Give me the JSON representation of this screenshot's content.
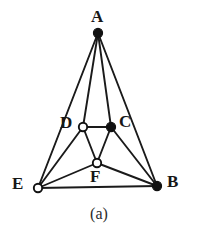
{
  "figure": {
    "caption": "(a)",
    "caption_x": 99,
    "caption_y": 205,
    "width": 198,
    "height": 238,
    "background_color": "#ffffff",
    "ink_color": "#171717",
    "edge_color": "#1a1a1a",
    "edge_width": 1.9,
    "filled_vertex_fill": "#111111",
    "open_vertex_fill": "#ffffff",
    "vertex_stroke": "#111111",
    "vertex_radius": 4.6,
    "open_vertex_radius": 4.2
  },
  "chart_data": {
    "type": "diagram",
    "title": "(a)",
    "subtype": "undirected-graph",
    "nodes": [
      {
        "id": "A",
        "label": "A",
        "x": 98,
        "y": 33,
        "style": "filled",
        "label_x": 91,
        "label_y": 8
      },
      {
        "id": "D",
        "label": "D",
        "x": 83,
        "y": 127,
        "style": "open",
        "label_x": 60,
        "label_y": 114
      },
      {
        "id": "C",
        "label": "C",
        "x": 111,
        "y": 127,
        "style": "filled",
        "label_x": 119,
        "label_y": 113
      },
      {
        "id": "E",
        "label": "E",
        "x": 38,
        "y": 188,
        "style": "open",
        "label_x": 12,
        "label_y": 175
      },
      {
        "id": "F",
        "label": "F",
        "x": 97,
        "y": 163,
        "style": "open",
        "label_x": 90,
        "label_y": 168
      },
      {
        "id": "B",
        "label": "B",
        "x": 157,
        "y": 186,
        "style": "filled",
        "label_x": 167,
        "label_y": 173
      }
    ],
    "edges": [
      {
        "from": "A",
        "to": "E"
      },
      {
        "from": "A",
        "to": "D"
      },
      {
        "from": "A",
        "to": "C"
      },
      {
        "from": "A",
        "to": "B"
      },
      {
        "from": "D",
        "to": "C"
      },
      {
        "from": "D",
        "to": "E"
      },
      {
        "from": "D",
        "to": "F"
      },
      {
        "from": "C",
        "to": "F"
      },
      {
        "from": "C",
        "to": "B"
      },
      {
        "from": "E",
        "to": "F"
      },
      {
        "from": "E",
        "to": "B"
      },
      {
        "from": "F",
        "to": "B"
      }
    ],
    "legend": {
      "filled": "filled vertex",
      "open": "open vertex"
    }
  }
}
